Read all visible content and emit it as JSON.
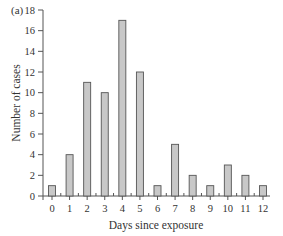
{
  "chart_data": {
    "type": "bar",
    "panel_label": "(a)",
    "title": "",
    "xlabel": "Days since exposure",
    "ylabel": "Number of cases",
    "categories": [
      "0",
      "1",
      "2",
      "3",
      "4",
      "5",
      "6",
      "7",
      "8",
      "9",
      "10",
      "11",
      "12"
    ],
    "values": [
      1,
      4,
      11,
      10,
      17,
      12,
      1,
      5,
      2,
      1,
      3,
      2,
      1
    ],
    "ylim": [
      0,
      18
    ],
    "yticks": [
      0,
      2,
      4,
      6,
      8,
      10,
      12,
      14,
      16,
      18
    ],
    "grid": false,
    "legend": "none",
    "colors": {
      "bar_fill": "#c8c8c8",
      "bar_stroke": "#555555",
      "axis": "#555555",
      "text": "#333333"
    }
  }
}
